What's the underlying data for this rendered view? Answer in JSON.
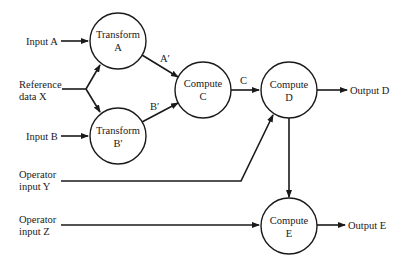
{
  "diagram": {
    "nodes": [
      {
        "id": "transform_a",
        "line1": "Transform",
        "line2": "A"
      },
      {
        "id": "transform_b",
        "line1": "Transform",
        "line2": "B'"
      },
      {
        "id": "compute_c",
        "line1": "Compute",
        "line2": "C"
      },
      {
        "id": "compute_d",
        "line1": "Compute",
        "line2": "D"
      },
      {
        "id": "compute_e",
        "line1": "Compute",
        "line2": "E"
      }
    ],
    "inputs": {
      "input_a": "Input A",
      "reference_x_line1": "Reference",
      "reference_x_line2": "data X",
      "input_b": "Input B",
      "operator_y_line1": "Operator",
      "operator_y_line2": "input Y",
      "operator_z_line1": "Operator",
      "operator_z_line2": "input Z"
    },
    "outputs": {
      "output_d": "Output D",
      "output_e": "Output E"
    },
    "edge_labels": {
      "a_prime": "A′",
      "b_prime": "B′",
      "c": "C"
    }
  }
}
